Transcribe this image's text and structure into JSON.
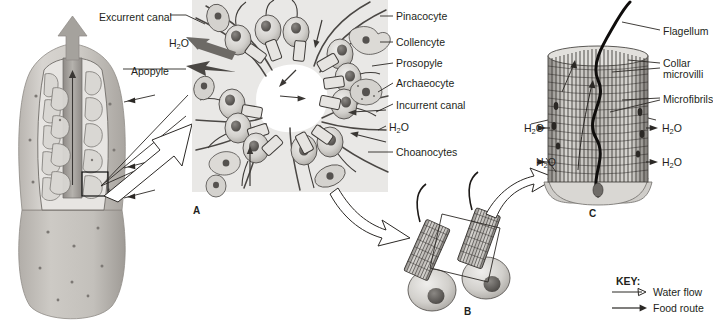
{
  "figure": {
    "title_letters": [
      {
        "letter": "A",
        "x": 193,
        "y": 205
      },
      {
        "letter": "B",
        "x": 464,
        "y": 306
      },
      {
        "letter": "C",
        "x": 589,
        "y": 208
      }
    ]
  },
  "panel_a": {
    "labels_left": [
      {
        "text": "Excurrent canal",
        "x": 99,
        "y": 11
      },
      {
        "text": "H",
        "sub": "2",
        "text2": "O",
        "x": 169,
        "y": 37
      },
      {
        "text": "Apopyle",
        "x": 131,
        "y": 65
      }
    ],
    "labels_right": [
      {
        "text": "Pinacocyte",
        "x": 396,
        "y": 12
      },
      {
        "text": "Collencyte",
        "x": 396,
        "y": 38
      },
      {
        "text": "Prosopyle",
        "x": 396,
        "y": 59
      },
      {
        "text": "Archaeocyte",
        "x": 396,
        "y": 79
      },
      {
        "text": "Incurrent canal",
        "x": 396,
        "y": 100
      },
      {
        "text": "H",
        "sub": "2",
        "text2": "O",
        "x": 388,
        "y": 122
      },
      {
        "text": "Choanocytes",
        "x": 396,
        "y": 148
      }
    ]
  },
  "panel_c": {
    "labels_right": [
      {
        "text": "Flagellum",
        "x": 663,
        "y": 27
      },
      {
        "text": "Collar",
        "x": 663,
        "y": 60
      },
      {
        "text": "microvilli",
        "x": 663,
        "y": 71
      },
      {
        "text": "Microfibrils",
        "x": 663,
        "y": 96
      }
    ],
    "water_labels": [
      {
        "text": "H",
        "sub": "2",
        "text2": "O",
        "x": 526,
        "y": 124,
        "side": "left"
      },
      {
        "text": "H",
        "sub": "2",
        "text2": "O",
        "x": 662,
        "y": 124,
        "side": "right"
      },
      {
        "text": "H",
        "sub": "2",
        "text2": "O",
        "x": 538,
        "y": 158,
        "side": "left"
      },
      {
        "text": "H",
        "sub": "2",
        "text2": "O",
        "x": 662,
        "y": 158,
        "side": "right"
      }
    ]
  },
  "key": {
    "title": "KEY:",
    "title_x": 616,
    "title_y": 281,
    "items": [
      {
        "label": "Water flow",
        "arrow": "open-arrow-icon",
        "x": 653,
        "y": 295
      },
      {
        "label": "Food route",
        "arrow": "solid-arrow-icon",
        "x": 653,
        "y": 311
      }
    ]
  },
  "colors": {
    "ink": "#231f20",
    "panel_a_background": "#e9e8e6",
    "sponge_body": "#c9c6c1",
    "sponge_shadow": "#a8a49f",
    "cell_fill": "#cfcdc9",
    "highlight_box_stroke": "#111111"
  }
}
